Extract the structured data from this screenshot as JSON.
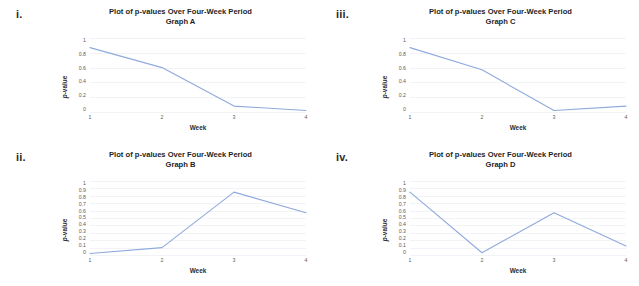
{
  "figure": {
    "background": "#ffffff",
    "line_color": "#8FAADC",
    "grid_color": "#f1f3f7"
  },
  "panels": [
    {
      "enumerator": "i.",
      "title": "Plot of p-values Over Four-Week Period",
      "subtitle": "Graph A",
      "chart_data": {
        "type": "line",
        "title": "Plot of p-values Over Four-Week Period",
        "subtitle": "Graph A",
        "xlabel": "Week",
        "ylabel": "p-value",
        "categories": [
          "1",
          "2",
          "3",
          "4"
        ],
        "x": [
          1,
          2,
          3,
          4
        ],
        "values": [
          0.87,
          0.6,
          0.08,
          0.02
        ],
        "ylim": [
          0,
          1
        ],
        "xlim": [
          1,
          4
        ],
        "yticks": [
          "0",
          "0.2",
          "0.4",
          "0.6",
          "0.8",
          "1"
        ],
        "ytick_values": [
          0,
          0.2,
          0.4,
          0.6,
          0.8,
          1
        ],
        "xticks": [
          "1",
          "2",
          "3",
          "4"
        ],
        "grid": true,
        "legend": false,
        "series_color": "#8FAADC"
      }
    },
    {
      "enumerator": "ii.",
      "title": "Plot of p-values Over Four-Week Period",
      "subtitle": "Graph B",
      "chart_data": {
        "type": "line",
        "title": "Plot of p-values Over Four-Week Period",
        "subtitle": "Graph B",
        "xlabel": "Week",
        "ylabel": "p-value",
        "categories": [
          "1",
          "2",
          "3",
          "4"
        ],
        "x": [
          1,
          2,
          3,
          4
        ],
        "values": [
          0.02,
          0.1,
          0.85,
          0.57
        ],
        "ylim": [
          0,
          1
        ],
        "xlim": [
          1,
          4
        ],
        "yticks": [
          "0",
          "0.1",
          "0.2",
          "0.3",
          "0.4",
          "0.5",
          "0.6",
          "0.7",
          "0.8",
          "0.9",
          "1"
        ],
        "ytick_values": [
          0,
          0.1,
          0.2,
          0.3,
          0.4,
          0.5,
          0.6,
          0.7,
          0.8,
          0.9,
          1
        ],
        "xticks": [
          "1",
          "2",
          "3",
          "4"
        ],
        "grid": true,
        "legend": false,
        "series_color": "#8FAADC"
      }
    },
    {
      "enumerator": "iii.",
      "title": "Plot of p-values Over Four-Week Period",
      "subtitle": "Graph C",
      "chart_data": {
        "type": "line",
        "title": "Plot of p-values Over Four-Week Period",
        "subtitle": "Graph C",
        "xlabel": "Week",
        "ylabel": "p-value",
        "categories": [
          "1",
          "2",
          "3",
          "4"
        ],
        "x": [
          1,
          2,
          3,
          4
        ],
        "values": [
          0.87,
          0.57,
          0.02,
          0.08
        ],
        "ylim": [
          0,
          1
        ],
        "xlim": [
          1,
          4
        ],
        "yticks": [
          "0",
          "0.2",
          "0.4",
          "0.6",
          "0.8",
          "1"
        ],
        "ytick_values": [
          0,
          0.2,
          0.4,
          0.6,
          0.8,
          1
        ],
        "xticks": [
          "1",
          "2",
          "3",
          "4"
        ],
        "grid": true,
        "legend": false,
        "series_color": "#8FAADC"
      }
    },
    {
      "enumerator": "iv.",
      "title": "Plot of p-values Over Four-Week Period",
      "subtitle": "Graph D",
      "chart_data": {
        "type": "line",
        "title": "Plot of p-values Over Four-Week Period",
        "subtitle": "Graph D",
        "xlabel": "Week",
        "ylabel": "p-value",
        "categories": [
          "1",
          "2",
          "3",
          "4"
        ],
        "x": [
          1,
          2,
          3,
          4
        ],
        "values": [
          0.85,
          0.03,
          0.57,
          0.12
        ],
        "ylim": [
          0,
          1
        ],
        "xlim": [
          1,
          4
        ],
        "yticks": [
          "0",
          "0.1",
          "0.2",
          "0.3",
          "0.4",
          "0.5",
          "0.6",
          "0.7",
          "0.8",
          "0.9",
          "1"
        ],
        "ytick_values": [
          0,
          0.1,
          0.2,
          0.3,
          0.4,
          0.5,
          0.6,
          0.7,
          0.8,
          0.9,
          1
        ],
        "xticks": [
          "1",
          "2",
          "3",
          "4"
        ],
        "grid": true,
        "legend": false,
        "series_color": "#8FAADC"
      }
    }
  ]
}
